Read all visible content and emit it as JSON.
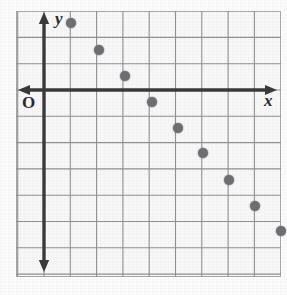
{
  "figure": {
    "kind": "coordinate-grid-scatter-plot",
    "background_color": "#f7f7f7",
    "border_color": "#a9a9ad",
    "grid_color": "#8f8f95",
    "axis_color": "#3a3a3c",
    "point_color": "#6e6d72"
  },
  "labels": {
    "y_axis": "y",
    "x_axis": "x",
    "origin": "O"
  },
  "chart_data": {
    "type": "scatter",
    "title": "",
    "xlabel": "x",
    "ylabel": "y",
    "origin_label": "O",
    "grid": true,
    "legend": "none",
    "axis_arrows": [
      "up",
      "down",
      "left",
      "right"
    ],
    "x_grid_step": 1,
    "y_grid_step": 1,
    "xlim": [
      -1,
      8
    ],
    "ylim": [
      -6,
      3
    ],
    "x": [
      1,
      2,
      3,
      4,
      5,
      6,
      7,
      8,
      9
    ],
    "y": [
      3,
      2,
      1,
      0,
      -1,
      -2,
      -3,
      -4,
      -5
    ],
    "points": [
      {
        "x": 1,
        "y": 3
      },
      {
        "x": 2,
        "y": 2
      },
      {
        "x": 3,
        "y": 1
      },
      {
        "x": 4,
        "y": 0
      },
      {
        "x": 5,
        "y": -1
      },
      {
        "x": 6,
        "y": -2
      },
      {
        "x": 7,
        "y": -3
      },
      {
        "x": 8,
        "y": -4
      },
      {
        "x": 9,
        "y": -5
      }
    ],
    "pixel_points": [
      {
        "px": 71,
        "py": 23
      },
      {
        "px": 99,
        "py": 50
      },
      {
        "px": 125,
        "py": 76
      },
      {
        "px": 152,
        "py": 102
      },
      {
        "px": 178,
        "py": 128
      },
      {
        "px": 203,
        "py": 153
      },
      {
        "px": 229,
        "py": 180
      },
      {
        "px": 255,
        "py": 206
      },
      {
        "px": 281,
        "py": 231
      }
    ],
    "annotations": []
  },
  "geometry": {
    "frame": {
      "left": 16,
      "top": 11,
      "width": 265,
      "height": 266
    },
    "x_axis_y": 90,
    "y_axis_x": 44,
    "cell_size": 26.3
  }
}
